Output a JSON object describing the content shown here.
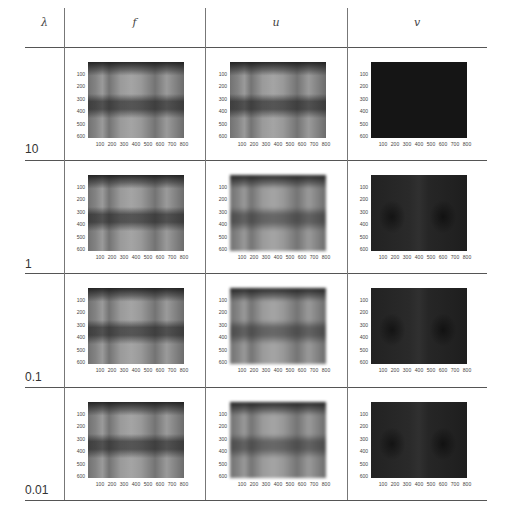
{
  "header": {
    "lambda_label": "λ",
    "columns": [
      "f",
      "u",
      "v"
    ]
  },
  "rows": [
    {
      "lambda": "10"
    },
    {
      "lambda": "1"
    },
    {
      "lambda": "0.1"
    },
    {
      "lambda": "0.01"
    }
  ],
  "axes": {
    "y_ticks": [
      "100",
      "200",
      "300",
      "400",
      "500",
      "600"
    ],
    "x_ticks": [
      "100",
      "200",
      "300",
      "400",
      "500",
      "600",
      "700",
      "800"
    ]
  },
  "colors": {
    "rule": "#555555",
    "v_panel_dark": "#1a1a1a"
  }
}
